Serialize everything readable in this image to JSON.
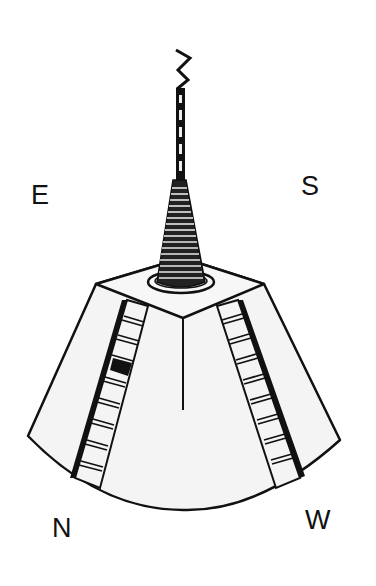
{
  "figure": {
    "compass_labels": {
      "east": "E",
      "south": "S",
      "north": "N",
      "west": "W"
    },
    "colors": {
      "ink": "#111111",
      "fill": "#f4f4f4",
      "background": "#ffffff"
    }
  }
}
